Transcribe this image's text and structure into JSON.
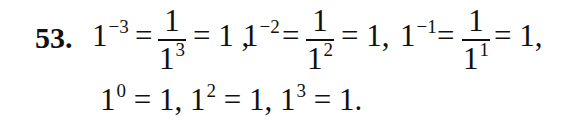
{
  "problem": {
    "number": "53.",
    "line1": {
      "term1": {
        "base": "1",
        "exp": "−3"
      },
      "eq1": "=",
      "frac1": {
        "numerator": "1",
        "den_base": "1",
        "den_exp": "3"
      },
      "eq1b": "= 1 ,",
      "term2": {
        "base": "1",
        "exp": "−2"
      },
      "eq2": "=",
      "frac2": {
        "numerator": "1",
        "den_base": "1",
        "den_exp": "2"
      },
      "eq2b": "= 1,",
      "term3": {
        "base": "1",
        "exp": "−1"
      },
      "eq3": "=",
      "frac3": {
        "numerator": "1",
        "den_base": "1",
        "den_exp": "1"
      },
      "eq3b": "= 1,"
    },
    "line2": {
      "a": {
        "base": "1",
        "exp": "0",
        "rest": " = 1, "
      },
      "b": {
        "base": "1",
        "exp": "2",
        "rest": " = 1, "
      },
      "c": {
        "base": "1",
        "exp": "3",
        "rest": " = 1."
      }
    }
  }
}
